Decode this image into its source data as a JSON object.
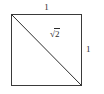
{
  "figure": {
    "kind": "geometry-diagram",
    "background_color": "#ffffff",
    "stroke_color": "#3a3a3a",
    "diagonal_color": "#2f2f2f",
    "text_color": "#2b2b2b",
    "square": {
      "left": 11,
      "top": 14,
      "right": 82,
      "bottom": 86
    },
    "diagonal": {
      "x1": 11,
      "y1": 14,
      "x2": 82,
      "y2": 86
    },
    "labels": {
      "top": "1",
      "right": "1",
      "diagonal_radix": "√",
      "diagonal_radicand": "2",
      "diagonal_full": "√2"
    }
  }
}
